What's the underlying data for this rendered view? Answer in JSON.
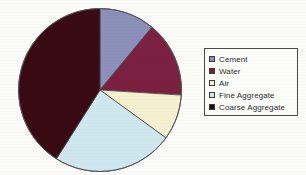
{
  "chart_data": {
    "type": "pie",
    "title": "",
    "categories": [
      "Cement",
      "Water",
      "Air",
      "Fine Aggregate",
      "Coarse Aggregate"
    ],
    "values": [
      11,
      15,
      9,
      24,
      41
    ],
    "unit": "percent",
    "colors": [
      "#8a90b8",
      "#7b2040",
      "#f5f0cf",
      "#cfe7ee",
      "#3a0a14"
    ],
    "legend_position": "right",
    "grid": false,
    "start_angle_deg": 0,
    "direction": "clockwise"
  },
  "legend": {
    "items": [
      {
        "label": "Cement",
        "color": "#8a90b8"
      },
      {
        "label": "Water",
        "color": "#7b2040"
      },
      {
        "label": "Air",
        "color": "#f5f0cf"
      },
      {
        "label": "Fine Aggregate",
        "color": "#cfe7ee"
      },
      {
        "label": "Coarse Aggregate",
        "color": "#1c0a10"
      }
    ]
  }
}
